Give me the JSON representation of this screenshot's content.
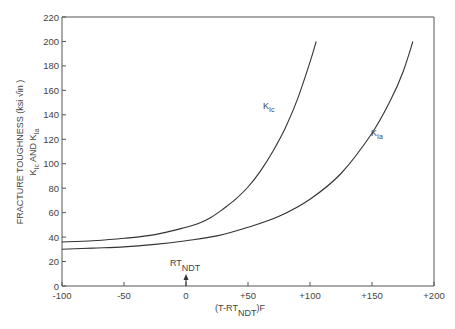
{
  "chart_data": {
    "type": "line",
    "title": "",
    "xlabel": "(T-RT_NDT)F",
    "ylabel": "FRACTURE TOUGHNESS (ksi √in) K_Ic AND K_Ia",
    "xlim": [
      -100,
      200
    ],
    "ylim": [
      0,
      220
    ],
    "xticks": [
      -100,
      -50,
      0,
      50,
      100,
      150,
      200
    ],
    "xtick_labels": [
      "-100",
      "-50",
      "0",
      "+50",
      "+100",
      "+150",
      "+200"
    ],
    "yticks": [
      0,
      20,
      40,
      60,
      80,
      100,
      120,
      140,
      160,
      180,
      200,
      220
    ],
    "grid": false,
    "legend": "inline labels",
    "annotations": [
      {
        "text": "RT_NDT",
        "x": 0,
        "note": "arrow pointing up at x=0"
      }
    ],
    "series": [
      {
        "name": "K_Ic",
        "x": [
          -100,
          -75,
          -50,
          -25,
          0,
          10,
          20,
          30,
          40,
          50,
          60,
          70,
          80,
          90,
          100,
          105
        ],
        "values": [
          36,
          37,
          39,
          42,
          48,
          51,
          56,
          63,
          71,
          81,
          94,
          110,
          129,
          153,
          183,
          200
        ]
      },
      {
        "name": "K_Ia",
        "x": [
          -100,
          -75,
          -50,
          -25,
          0,
          25,
          50,
          75,
          100,
          125,
          150,
          165,
          175,
          183
        ],
        "values": [
          30,
          31,
          32,
          34,
          37,
          41,
          48,
          57,
          71,
          92,
          125,
          152,
          175,
          200
        ]
      }
    ]
  },
  "axis": {
    "y_title_line1": "FRACTURE  TOUGHNESS",
    "y_title_units": "(ksi √in )",
    "y_title_line2_a": "K",
    "y_title_line2_sub1": "Ic",
    "y_title_line2_b": " AND K",
    "y_title_line2_sub2": "Ia",
    "x_title_a": "(T-RT",
    "x_title_sub": "NDT",
    "x_title_b": ")F"
  },
  "labels": {
    "kic_main": "K",
    "kic_sub": "Ic",
    "kia_main": "K",
    "kia_sub": "Ia",
    "rt_main": "RT",
    "rt_sub": "NDT"
  },
  "ytick_labels": [
    "0",
    "20",
    "40",
    "60",
    "80",
    "100",
    "120",
    "140",
    "160",
    "180",
    "200",
    "220"
  ]
}
